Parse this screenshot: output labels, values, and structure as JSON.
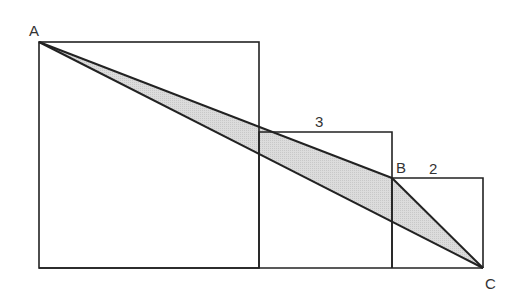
{
  "diagram": {
    "colors": {
      "background": "#ffffff",
      "stroke": "#222222",
      "shade": "#d9d9d9",
      "label": "#333333"
    },
    "squares": [
      {
        "name": "large",
        "x": 39,
        "y": 42,
        "width": 220,
        "height": 226
      },
      {
        "name": "medium",
        "x": 259,
        "y": 132,
        "width": 133,
        "height": 136,
        "side_label": "3"
      },
      {
        "name": "small",
        "x": 392,
        "y": 178,
        "width": 91,
        "height": 90,
        "side_label": "2"
      }
    ],
    "points": {
      "A": {
        "label": "A",
        "x": 39,
        "y": 42
      },
      "B": {
        "label": "B",
        "x": 392,
        "y": 178
      },
      "C": {
        "label": "C",
        "x": 483,
        "y": 268
      }
    },
    "labels": {
      "A": "A",
      "B": "B",
      "C": "C",
      "side_medium": "3",
      "side_small": "2"
    },
    "shaded_triangle": "ABC"
  }
}
